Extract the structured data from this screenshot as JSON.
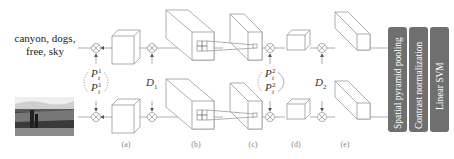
{
  "tags_text": {
    "line1": "canyon, dogs,",
    "line2": "free, sky"
  },
  "image": {
    "description": "grayscale canyon photo with dogs",
    "icon": "photo-thumbnail"
  },
  "pair_labels": {
    "p1_top": "P",
    "p1_top_sup": "1",
    "p1_top_sub": "t",
    "p1_bottom": "P",
    "p1_bottom_sup": "1",
    "p1_bottom_sub": "i",
    "d1": "D",
    "d1_sub": "1",
    "p2_top": "P",
    "p2_top_sup": "2",
    "p2_top_sub": "t",
    "p2_bottom": "P",
    "p2_bottom_sup": "2",
    "p2_bottom_sub": "i",
    "d2": "D",
    "d2_sub": "2"
  },
  "stage_captions": [
    "(a)",
    "(b)",
    "(c)",
    "(d)",
    "(e)"
  ],
  "pipeline_bars": [
    {
      "label": "Spatial pyramid pooling"
    },
    {
      "label": "Contrast normalization"
    },
    {
      "label": "Linear SVM"
    }
  ],
  "colors": {
    "bar_fill": "#6f6f6f",
    "line": "#9a9a9a",
    "text": "#222222"
  }
}
